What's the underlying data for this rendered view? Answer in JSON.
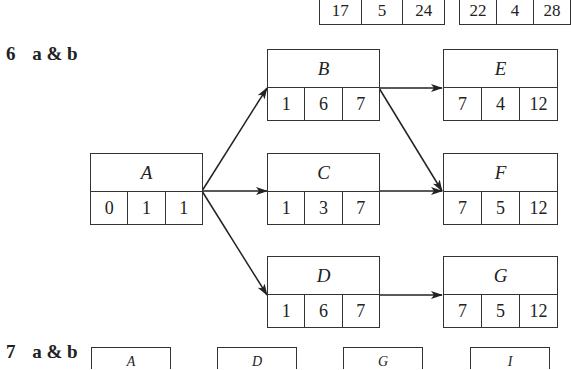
{
  "top_partial": [
    {
      "values": [
        "17",
        "5",
        "24"
      ]
    },
    {
      "values": [
        "22",
        "4",
        "28"
      ]
    }
  ],
  "section6": {
    "number": "6",
    "label": "a & b",
    "nodes": {
      "A": {
        "name": "A",
        "values": [
          "0",
          "1",
          "1"
        ]
      },
      "B": {
        "name": "B",
        "values": [
          "1",
          "6",
          "7"
        ]
      },
      "C": {
        "name": "C",
        "values": [
          "1",
          "3",
          "7"
        ]
      },
      "D": {
        "name": "D",
        "values": [
          "1",
          "6",
          "7"
        ]
      },
      "E": {
        "name": "E",
        "values": [
          "7",
          "4",
          "12"
        ]
      },
      "F": {
        "name": "F",
        "values": [
          "7",
          "5",
          "12"
        ]
      },
      "G": {
        "name": "G",
        "values": [
          "7",
          "5",
          "12"
        ]
      }
    },
    "edges": [
      [
        "A",
        "B"
      ],
      [
        "A",
        "C"
      ],
      [
        "A",
        "D"
      ],
      [
        "B",
        "E"
      ],
      [
        "B",
        "F"
      ],
      [
        "C",
        "F"
      ],
      [
        "D",
        "G"
      ]
    ]
  },
  "section7": {
    "number": "7",
    "label": "a & b",
    "stubs": [
      "A",
      "D",
      "G",
      "I"
    ]
  }
}
